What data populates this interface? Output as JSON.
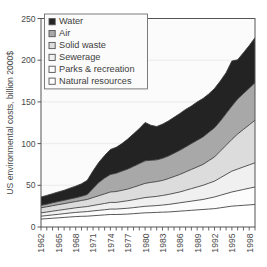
{
  "chart_data": {
    "type": "area",
    "title": "",
    "subtitle": "",
    "xlabel": "",
    "ylabel": "US environmental costs, billion 2000$",
    "ylim": [
      0,
      250
    ],
    "yticks": [
      0,
      50,
      100,
      150,
      200,
      250
    ],
    "ytick_labels": [
      "0",
      "50",
      "100",
      "150",
      "200",
      "250"
    ],
    "xlim": [
      1962,
      1999
    ],
    "xticks_every": 1,
    "xtick_label_every": 3,
    "xtick_labels": [
      "1962",
      "1965",
      "1968",
      "1971",
      "1974",
      "1977",
      "1980",
      "1983",
      "1986",
      "1989",
      "1992",
      "1995",
      "1998"
    ],
    "grid": "horizontal-faint",
    "legend_position": "upper-left-inside",
    "stacked": true,
    "stack_order_bottom_to_top": [
      "Natural resources",
      "Parks & recreation",
      "Sewerage",
      "Solid waste",
      "Air",
      "Water"
    ],
    "x": [
      1962,
      1963,
      1964,
      1965,
      1966,
      1967,
      1968,
      1969,
      1970,
      1971,
      1972,
      1973,
      1974,
      1975,
      1976,
      1977,
      1978,
      1979,
      1980,
      1981,
      1982,
      1983,
      1984,
      1985,
      1986,
      1987,
      1988,
      1989,
      1990,
      1991,
      1992,
      1993,
      1994,
      1995,
      1996,
      1997,
      1998,
      1999
    ],
    "series": [
      {
        "name": "Natural resources",
        "color": "#ffffff",
        "values": [
          9.5,
          10,
          10.5,
          11,
          11.5,
          12,
          12.5,
          12.8,
          13,
          13.5,
          14,
          14.5,
          15,
          15,
          15.2,
          15.5,
          16,
          16.5,
          17,
          17.2,
          17.5,
          17.8,
          18,
          18.5,
          19,
          19.5,
          20,
          20.5,
          21,
          21.5,
          22,
          23,
          24,
          25,
          25.5,
          26,
          26.5,
          27
        ]
      },
      {
        "name": "Parks & recreation",
        "color": "#fcfcfc",
        "values": [
          3.5,
          3.7,
          4,
          4.2,
          4.5,
          4.8,
          5,
          5.2,
          5.5,
          5.8,
          6,
          6.2,
          6.5,
          6.5,
          6.8,
          7,
          7.2,
          7.5,
          7.8,
          8,
          8.2,
          8.5,
          9,
          9.5,
          10,
          10.5,
          11,
          11.5,
          12,
          13,
          14,
          15,
          16,
          17,
          18,
          19,
          20,
          21
        ]
      },
      {
        "name": "Sewerage",
        "color": "#f0f0f0",
        "values": [
          4,
          4.2,
          4.5,
          4.8,
          5,
          5.2,
          5.5,
          5.8,
          6,
          6.5,
          7,
          7.5,
          8,
          8,
          8.5,
          9,
          9.5,
          10,
          10.5,
          10.8,
          11,
          11.5,
          12,
          12.5,
          13,
          14,
          15,
          16,
          17,
          18,
          19,
          21,
          23,
          25,
          26,
          27,
          28,
          29
        ]
      },
      {
        "name": "Solid waste",
        "color": "#dcdcdc",
        "values": [
          6,
          6.3,
          6.5,
          6.8,
          7,
          7.3,
          7.5,
          8,
          8.5,
          9.5,
          10.5,
          11.5,
          12.5,
          13,
          13.5,
          14,
          15,
          16,
          17,
          17.5,
          17.8,
          18,
          19,
          20,
          21,
          22,
          23,
          24,
          25,
          27,
          29,
          32,
          35,
          38,
          42,
          45,
          48,
          51
        ]
      },
      {
        "name": "Air",
        "color": "#a8a8a8",
        "values": [
          3,
          3.2,
          3.5,
          3.8,
          4,
          4.3,
          4.5,
          5,
          6,
          11,
          16,
          19,
          21,
          22,
          23,
          24,
          25,
          26,
          27,
          26.5,
          26,
          26.5,
          27,
          28,
          29,
          30,
          31,
          32,
          33,
          34,
          35,
          36,
          38,
          40,
          42,
          43,
          44,
          45
        ]
      },
      {
        "name": "Water",
        "color": "#232323",
        "values": [
          10,
          10.5,
          11,
          11.5,
          12,
          13,
          14,
          15,
          17,
          21,
          24,
          27,
          30,
          31,
          33,
          36,
          39,
          42,
          46,
          42,
          40,
          41,
          42,
          43,
          44,
          45,
          45,
          46,
          46,
          46,
          47,
          48,
          49,
          54,
          47,
          49,
          51,
          54
        ]
      }
    ],
    "annotations": []
  },
  "legend": {
    "items": [
      {
        "label": "Water",
        "swatch": "#232323"
      },
      {
        "label": "Air",
        "swatch": "#a8a8a8"
      },
      {
        "label": "Solid waste",
        "swatch": "#dcdcdc"
      },
      {
        "label": "Sewerage",
        "swatch": "#f0f0f0"
      },
      {
        "label": "Parks & recreation",
        "swatch": "#fcfcfc"
      },
      {
        "label": "Natural resources",
        "swatch": "#ffffff"
      }
    ]
  }
}
